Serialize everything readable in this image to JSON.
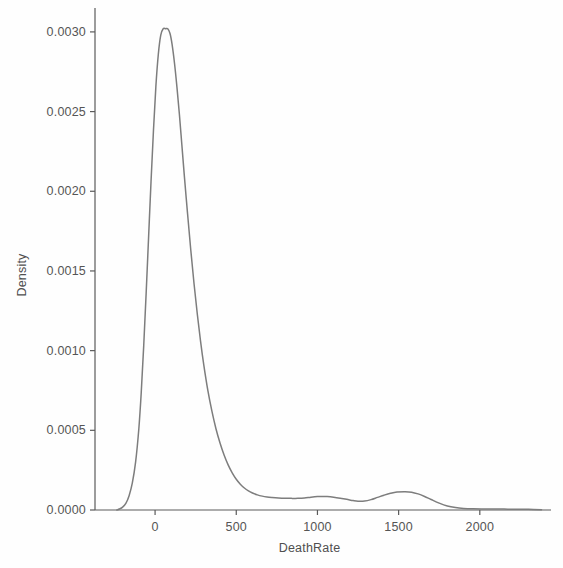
{
  "figure": {
    "background_color": "#fefefe",
    "line_color": "#7d7d7d",
    "axis_color": "#5a5a5a",
    "text_color": "#4f4f4f"
  },
  "axes": {
    "xlabel": "DeathRate",
    "ylabel": "Density",
    "x_tick_labels": [
      "0",
      "500",
      "1000",
      "1500",
      "2000"
    ],
    "y_tick_labels": [
      "0.0000",
      "0.0005",
      "0.0010",
      "0.0015",
      "0.0020",
      "0.0025",
      "0.0030"
    ]
  },
  "chart_data": {
    "type": "line",
    "title": "",
    "subtitle": "",
    "xlabel": "DeathRate",
    "ylabel": "Density",
    "grid": false,
    "legend": false,
    "legend_position": "none",
    "xlim": [
      -370,
      2420
    ],
    "ylim": [
      0.0,
      0.00315
    ],
    "xticks": [
      0,
      500,
      1000,
      1500,
      2000
    ],
    "yticks": [
      0.0,
      0.0005,
      0.001,
      0.0015,
      0.002,
      0.0025,
      0.003
    ],
    "xtick_labels": [
      "0",
      "500",
      "1000",
      "1500",
      "2000"
    ],
    "ytick_labels": [
      "0.0000",
      "0.0005",
      "0.0010",
      "0.0015",
      "0.0020",
      "0.0025",
      "0.0030"
    ],
    "annotations": [
      {
        "text": "primary mode",
        "x": 78,
        "y": 0.00302
      },
      {
        "text": "secondary bump",
        "x": 1030,
        "y": 8.5e-05
      },
      {
        "text": "tertiary bump",
        "x": 1540,
        "y": 0.000115
      }
    ],
    "series": [
      {
        "name": "Kernel density estimate",
        "color": "#7d7d7d",
        "x": [
          -235,
          -220,
          -200,
          -180,
          -160,
          -140,
          -120,
          -100,
          -85,
          -70,
          -55,
          -40,
          -25,
          -10,
          5,
          20,
          35,
          50,
          65,
          78,
          92,
          105,
          120,
          135,
          150,
          165,
          180,
          200,
          220,
          240,
          260,
          280,
          300,
          325,
          350,
          375,
          400,
          425,
          450,
          475,
          500,
          525,
          550,
          575,
          600,
          630,
          660,
          690,
          720,
          760,
          800,
          840,
          880,
          920,
          960,
          1000,
          1030,
          1060,
          1100,
          1140,
          1180,
          1220,
          1250,
          1290,
          1330,
          1370,
          1410,
          1450,
          1490,
          1540,
          1580,
          1620,
          1660,
          1700,
          1750,
          1800,
          1850,
          1900,
          1960,
          2020,
          2080,
          2150,
          2220,
          2300,
          2380
        ],
        "y": [
          0.0,
          6e-06,
          1.8e-05,
          4.2e-05,
          9e-05,
          0.00017,
          0.0003,
          0.00051,
          0.00074,
          0.00103,
          0.00136,
          0.00171,
          0.00206,
          0.00238,
          0.00266,
          0.00286,
          0.00298,
          0.00302,
          0.00302,
          0.00302,
          0.00299,
          0.00292,
          0.0028,
          0.00265,
          0.00248,
          0.00229,
          0.0021,
          0.00186,
          0.00163,
          0.00142,
          0.00123,
          0.00106,
          0.00091,
          0.00075,
          0.00062,
          0.00051,
          0.00042,
          0.000345,
          0.000283,
          0.000233,
          0.000193,
          0.000162,
          0.000138,
          0.00012,
          0.000107,
          9.5e-05,
          8.7e-05,
          8.2e-05,
          7.9e-05,
          7.6e-05,
          7.4e-05,
          7.3e-05,
          7.3e-05,
          7.5e-05,
          8e-05,
          8.4e-05,
          8.5e-05,
          8.4e-05,
          8e-05,
          7.4e-05,
          6.7e-05,
          5.9e-05,
          5.5e-05,
          5.6e-05,
          6.5e-05,
          7.9e-05,
          9.3e-05,
          0.000105,
          0.000113,
          0.000115,
          0.000112,
          0.000101,
          8.5e-05,
          6.6e-05,
          4.3e-05,
          2.5e-05,
          1.5e-05,
          1e-05,
          7.5e-06,
          6.5e-06,
          6e-06,
          5.5e-06,
          5e-06,
          4e-06,
          2e-06
        ]
      }
    ]
  },
  "geometry": {
    "plot_left": 95,
    "plot_right": 548,
    "plot_top": 8,
    "plot_bottom": 510
  }
}
